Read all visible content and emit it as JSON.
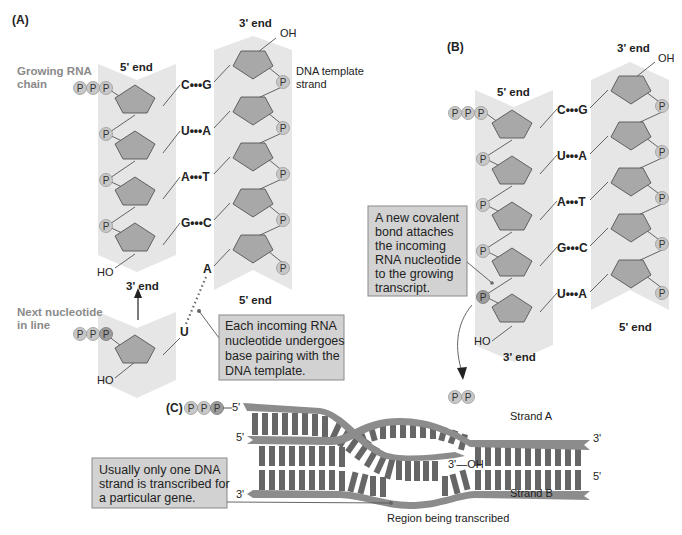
{
  "panels": {
    "A": {
      "label": "(A)",
      "rna_label_line1": "Growing RNA",
      "rna_label_line2": "chain",
      "rna_5_end": "5' end",
      "rna_3_end": "3' end",
      "dna_3_end": "3' end",
      "dna_5_end": "5' end",
      "dna_label_line1": "DNA template",
      "dna_label_line2": "strand",
      "oh": "OH",
      "ho": "HO",
      "pairs": [
        "C•••G",
        "U•••A",
        "A•••T",
        "G•••C"
      ],
      "unpaired_dna_base": "A",
      "incoming_base": "U",
      "next_label_line1": "Next nucleotide",
      "next_label_line2": "in line",
      "incoming_ho": "HO",
      "phosphate": "P",
      "note_lines": [
        "Each incoming RNA",
        "nucleotide undergoes",
        "base pairing with the",
        "DNA template."
      ]
    },
    "B": {
      "label": "(B)",
      "rna_5_end": "5' end",
      "rna_3_end": "3' end",
      "dna_3_end": "3' end",
      "dna_5_end": "5' end",
      "oh": "OH",
      "ho": "HO",
      "pairs": [
        "C•••G",
        "U•••A",
        "A•••T",
        "G•••C",
        "U•••A"
      ],
      "phosphate": "P",
      "note_lines": [
        "A new covalent",
        "bond attaches",
        "the incoming",
        "RNA nucleotide",
        "to the growing",
        "transcript."
      ]
    },
    "C": {
      "label": "(C)",
      "rna_5": "5'",
      "strand_a_label": "Strand A",
      "strand_b_label": "Strand B",
      "strand_a_left": "5'",
      "strand_a_right": "3'",
      "strand_b_left": "3'",
      "strand_b_right": "5'",
      "rna_3_oh": "3'—OH",
      "region_label": "Region being transcribed",
      "phosphate": "P",
      "note_lines": [
        "Usually only one DNA",
        "strand is transcribed for",
        "a particular gene."
      ]
    }
  },
  "colors": {
    "band": "#e6e6e6",
    "sugar": "#a8a8a8",
    "phosphate": "#c8c8c8",
    "callout_box": "#d2d2d2",
    "label_grey": "#8a8a8a",
    "rung": "#666666",
    "strand": "#8c8c8c"
  }
}
